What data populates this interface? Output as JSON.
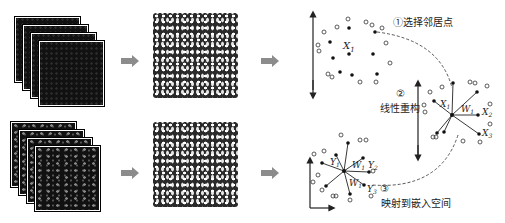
{
  "diagram": {
    "type": "locally-linear-embedding-pipeline",
    "rows": [
      {
        "id": "row-1",
        "input": "image-stack",
        "processed": "particle-map"
      },
      {
        "id": "row-2",
        "input": "image-stack",
        "processed": "particle-map"
      }
    ],
    "steps": [
      {
        "number": "①",
        "label": "选择邻居点"
      },
      {
        "number": "②",
        "label": "线性重构"
      },
      {
        "number": "③",
        "label": "映射到嵌入空间"
      }
    ],
    "symbols": {
      "x1": "X",
      "x1_sub": "1",
      "x2": "X",
      "x2_sub": "2",
      "x3": "X",
      "x3_sub": "3",
      "w1": "W",
      "w1_sub": "1",
      "y1": "Y",
      "y1_sub": "1",
      "y2": "Y",
      "y2_sub": "2",
      "y3": "Y",
      "y3_sub": "3"
    },
    "colors": {
      "arrow_fill": "#8c8c8c",
      "image_dark": "#111111",
      "line": "#222222"
    }
  }
}
